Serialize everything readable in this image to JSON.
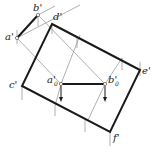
{
  "diagram": {
    "type": "descriptive-geometry-projection",
    "points": {
      "a_prime": {
        "label": "a'",
        "x": 17,
        "y": 38
      },
      "b_prime": {
        "label": "b'",
        "x": 38,
        "y": 15
      },
      "c_prime": {
        "label": "c'",
        "x": 22,
        "y": 86
      },
      "d_prime": {
        "label": "d'",
        "x": 52,
        "y": 24
      },
      "e_prime": {
        "label": "e'",
        "x": 140,
        "y": 70
      },
      "f_prime": {
        "label": "f'",
        "x": 110,
        "y": 132
      },
      "a0_prime": {
        "label": "a'",
        "sub": "0",
        "x": 61,
        "y": 84
      },
      "b0_prime": {
        "label": "b'",
        "sub": "0",
        "x": 105,
        "y": 84
      }
    },
    "labels": {
      "a": "a'",
      "b": "b'",
      "c": "c'",
      "d": "d'",
      "e": "e'",
      "f": "f'",
      "a0": "a'",
      "b0": "b'",
      "sub0": "0"
    },
    "colors": {
      "thick": "#1a1a1a",
      "thin": "#9a9a9a"
    }
  }
}
